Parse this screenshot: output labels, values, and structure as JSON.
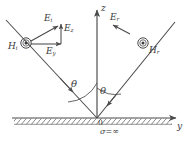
{
  "figure": {
    "colors": {
      "line": "#4a4a4a",
      "text": "#3a3a3a",
      "hatch": "#6a6a6a",
      "background": "#ffffff"
    },
    "axes": {
      "z_label": "z",
      "y_label": "y",
      "origin_label": "0"
    },
    "boundary": {
      "conductivity_symbol": "σ",
      "conductivity_equals": "=",
      "conductivity_value": "∞"
    },
    "angles": {
      "incident_label": "θ",
      "reflected_label": "θ"
    },
    "incident": {
      "h_symbol": "H",
      "h_subscript": "i",
      "h_marker": "circled-dot-icon",
      "e_symbol": "E",
      "e_subscript": "i",
      "ez_symbol": "E",
      "ez_subscript": "z",
      "ey_symbol": "E",
      "ey_subscript": "y"
    },
    "reflected": {
      "h_symbol": "H",
      "h_subscript": "r",
      "h_marker": "circled-dot-icon",
      "e_symbol": "E",
      "e_subscript": "r"
    }
  }
}
